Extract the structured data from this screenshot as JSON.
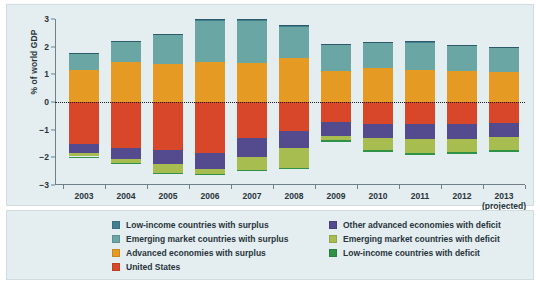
{
  "chart_data": {
    "type": "bar",
    "stacked": true,
    "title": "",
    "xlabel": "",
    "ylabel": "% of world GDP",
    "ylim": [
      -3,
      3
    ],
    "yticks": [
      3,
      2,
      1,
      0,
      -1,
      -2,
      -3
    ],
    "ytick_labels": [
      "3",
      "2",
      "1",
      "0",
      "−1",
      "−2",
      "−3"
    ],
    "grid": false,
    "zero_line": true,
    "legend_position": "bottom",
    "categories": [
      "2003",
      "2004",
      "2005",
      "2006",
      "2007",
      "2008",
      "2009",
      "2010",
      "2011",
      "2012",
      "2013"
    ],
    "category_sublabels": [
      "",
      "",
      "",
      "",
      "",
      "",
      "",
      "",
      "",
      "",
      "(projected)"
    ],
    "series": [
      {
        "name": "Low-income countries with surplus",
        "color": "#3f7f91",
        "sign": "positive",
        "values": [
          0.03,
          0.04,
          0.05,
          0.06,
          0.07,
          0.08,
          0.04,
          0.04,
          0.05,
          0.04,
          0.04
        ]
      },
      {
        "name": "Emerging market countries with surplus",
        "color": "#6aa6a4",
        "sign": "positive",
        "values": [
          0.6,
          0.73,
          1.05,
          1.5,
          1.52,
          1.12,
          0.93,
          0.9,
          1.01,
          0.88,
          0.86
        ]
      },
      {
        "name": "Advanced economies with surplus",
        "color": "#e49a23",
        "sign": "positive",
        "values": [
          1.15,
          1.44,
          1.36,
          1.44,
          1.41,
          1.6,
          1.13,
          1.23,
          1.14,
          1.13,
          1.1
        ]
      },
      {
        "name": "United States",
        "color": "#d9472a",
        "sign": "negative",
        "values": [
          -1.5,
          -1.65,
          -1.75,
          -1.85,
          -1.3,
          -1.05,
          -0.72,
          -0.8,
          -0.8,
          -0.78,
          -0.76
        ]
      },
      {
        "name": "Other advanced economies with deficit",
        "color": "#534b8e",
        "sign": "negative",
        "values": [
          -0.33,
          -0.42,
          -0.5,
          -0.58,
          -0.68,
          -0.62,
          -0.52,
          -0.5,
          -0.55,
          -0.54,
          -0.5
        ]
      },
      {
        "name": "Emerging market countries with deficit",
        "color": "#a8bd4f",
        "sign": "negative",
        "values": [
          -0.14,
          -0.14,
          -0.32,
          -0.18,
          -0.48,
          -0.7,
          -0.14,
          -0.44,
          -0.5,
          -0.48,
          -0.48
        ]
      },
      {
        "name": "Low-income countries with deficit",
        "color": "#2f9246",
        "sign": "negative",
        "values": [
          -0.02,
          -0.03,
          -0.04,
          -0.04,
          -0.05,
          -0.05,
          -0.06,
          -0.07,
          -0.07,
          -0.07,
          -0.07
        ]
      }
    ],
    "legend": {
      "column_left": [
        "Low-income countries with surplus",
        "Emerging market countries with surplus",
        "Advanced economies with surplus",
        "United States"
      ],
      "column_right": [
        "Other advanced economies with deficit",
        "Emerging market countries with deficit",
        "Low-income countries with deficit"
      ]
    },
    "colors": {
      "low_income_surplus": "#3f7f91",
      "emerging_surplus": "#6aa6a4",
      "advanced_surplus": "#e49a23",
      "united_states": "#d9472a",
      "other_advanced_deficit": "#534b8e",
      "emerging_deficit": "#a8bd4f",
      "low_income_deficit": "#2f9246",
      "panel_background": "#e4edf0",
      "axis": "#6f8088",
      "text": "#28353b"
    }
  }
}
